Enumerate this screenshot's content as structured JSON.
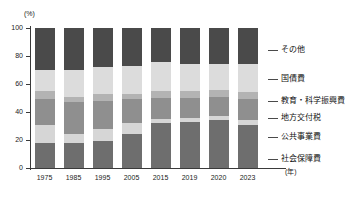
{
  "chart_data": {
    "type": "bar",
    "title": "",
    "subtitle": "",
    "stacked": true,
    "normalized_percent": true,
    "xlabel": "(年)",
    "ylabel": "(%)",
    "ylim": [
      0,
      100
    ],
    "yticks": [
      0,
      20,
      40,
      60,
      80,
      100
    ],
    "ytick_labels": [
      "0",
      "20",
      "40",
      "60",
      "80",
      "100"
    ],
    "grid": false,
    "legend_position": "right",
    "categories": [
      "1975",
      "1985",
      "1995",
      "2005",
      "2015",
      "2019",
      "2020",
      "2023"
    ],
    "series": [
      {
        "name": "社会保障費",
        "color": "#6e6e6e",
        "values": [
          18,
          18,
          19,
          24,
          32,
          33,
          34,
          31
        ]
      },
      {
        "name": "公共事業費",
        "color": "#d6d6d6",
        "values": [
          13,
          6,
          9,
          8,
          3,
          3,
          3,
          3
        ]
      },
      {
        "name": "地方交付税",
        "color": "#8f8f8f",
        "values": [
          18,
          23,
          20,
          17,
          15,
          14,
          14,
          15
        ]
      },
      {
        "name": "教育・科学振興費",
        "color": "#b3b3b3",
        "values": [
          6,
          4,
          5,
          4,
          5,
          5,
          5,
          5
        ]
      },
      {
        "name": "国債費",
        "color": "#dcdcdc",
        "values": [
          15,
          19,
          19,
          20,
          21,
          19,
          18,
          20
        ]
      },
      {
        "name": "その他",
        "color": "#4a4a4a",
        "values": [
          30,
          30,
          28,
          27,
          24,
          26,
          26,
          26
        ]
      }
    ]
  },
  "axes": {
    "y_unit": "(%)",
    "x_unit": "(年)"
  },
  "legend": {
    "items": [
      {
        "label": "その他"
      },
      {
        "label": "国債費"
      },
      {
        "label": "教育・科学振興費"
      },
      {
        "label": "地方交付税"
      },
      {
        "label": "公共事業費"
      },
      {
        "label": "社会保障費"
      }
    ]
  },
  "colors": {
    "axis": "#3a3a3a",
    "text": "#1a1a1a",
    "background": "#ffffff"
  }
}
